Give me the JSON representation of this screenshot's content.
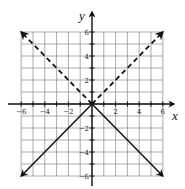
{
  "chart_data": {
    "type": "line",
    "title": "",
    "xlabel": "x",
    "ylabel": "y",
    "xlim": [
      -6,
      6
    ],
    "ylim": [
      -6,
      6
    ],
    "grid": true,
    "x_tick_labels": [
      "-6",
      "-4",
      "-2",
      "2",
      "4",
      "6"
    ],
    "y_tick_labels": [
      "6",
      "4",
      "2",
      "-2",
      "-4",
      "-6"
    ],
    "series": [
      {
        "name": "dashed",
        "style": "dashed",
        "arrows": "both",
        "points": [
          [
            -6,
            6
          ],
          [
            0,
            0
          ],
          [
            6,
            6
          ]
        ]
      },
      {
        "name": "solid",
        "style": "solid",
        "arrows": "both",
        "points": [
          [
            -6,
            -6
          ],
          [
            0,
            0
          ],
          [
            6,
            -6
          ]
        ]
      }
    ]
  },
  "colors": {
    "grid": "#888888",
    "axis": "#111111",
    "line": "#111111"
  }
}
